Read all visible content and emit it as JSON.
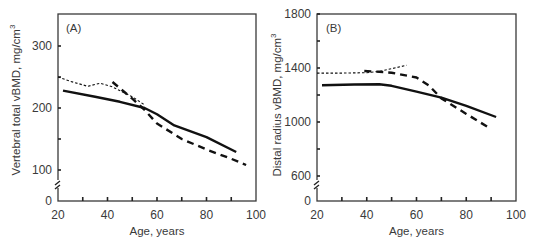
{
  "chart_data": [
    {
      "type": "line",
      "panel_label": "(A)",
      "title": "",
      "xlabel": "Age, years",
      "ylabel": "Vertebral total  vBMD, mg/cm",
      "ylabel_superscript": "3",
      "xlim": [
        20,
        100
      ],
      "ylim_display": [
        0,
        350
      ],
      "axis_break": true,
      "x_ticks": [
        20,
        40,
        60,
        80,
        100
      ],
      "y_ticks": [
        0,
        100,
        200,
        300
      ],
      "x_tick_labels": [
        "20",
        "40",
        "60",
        "80",
        "100"
      ],
      "y_tick_labels": [
        "0",
        "100",
        "200",
        "300"
      ],
      "grid": false,
      "legend": null,
      "series": [
        {
          "name": "solid",
          "style": "solid",
          "x": [
            22,
            35,
            45,
            55,
            60,
            67,
            80,
            92
          ],
          "y": [
            228,
            218,
            210,
            200,
            190,
            172,
            153,
            129
          ]
        },
        {
          "name": "dashed",
          "style": "dashed",
          "x": [
            42,
            50,
            55,
            60,
            70,
            80,
            90,
            96
          ],
          "y": [
            242,
            215,
            197,
            175,
            150,
            133,
            118,
            108
          ]
        },
        {
          "name": "dotted",
          "style": "dotted",
          "x": [
            20,
            25,
            32,
            37,
            42,
            50,
            55
          ],
          "y": [
            250,
            243,
            235,
            240,
            234,
            218,
            205
          ]
        }
      ]
    },
    {
      "type": "line",
      "panel_label": "(B)",
      "title": "",
      "xlabel": "Age, years",
      "ylabel": "Distal radius vBMD, mg/cm",
      "ylabel_superscript": "3",
      "xlim": [
        20,
        100
      ],
      "ylim_display": [
        0,
        1800
      ],
      "axis_break": true,
      "x_ticks": [
        20,
        40,
        60,
        80,
        100
      ],
      "y_ticks": [
        0,
        600,
        1000,
        1400,
        1800
      ],
      "x_tick_labels": [
        "20",
        "40",
        "60",
        "80",
        "100"
      ],
      "y_tick_labels": [
        "0",
        "600",
        "1000",
        "1400",
        "1800"
      ],
      "grid": false,
      "legend": null,
      "series": [
        {
          "name": "solid",
          "style": "solid",
          "x": [
            22,
            35,
            45,
            50,
            60,
            70,
            80,
            92
          ],
          "y": [
            1272,
            1278,
            1280,
            1268,
            1225,
            1180,
            1120,
            1037
          ]
        },
        {
          "name": "dashed",
          "style": "dashed",
          "x": [
            39,
            45,
            50,
            60,
            65,
            70,
            80,
            90
          ],
          "y": [
            1378,
            1372,
            1365,
            1330,
            1270,
            1175,
            1060,
            948
          ]
        },
        {
          "name": "dotted",
          "style": "dotted",
          "x": [
            20,
            30,
            40,
            45,
            50,
            56
          ],
          "y": [
            1362,
            1362,
            1365,
            1375,
            1395,
            1420
          ]
        }
      ]
    }
  ]
}
